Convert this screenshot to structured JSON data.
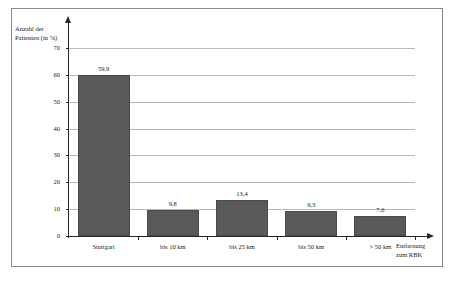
{
  "chart_data": {
    "type": "bar",
    "title": "",
    "categories": [
      "Stuttgart",
      "bis 10 km",
      "bis 25 km",
      "bis 50 km",
      "> 50 km"
    ],
    "values": [
      59.9,
      9.8,
      13.4,
      9.3,
      7.6
    ],
    "value_labels": [
      "59,9",
      "9,8",
      "13,4",
      "9,3",
      "7,6"
    ],
    "ylabel_line1": "Anzahl der",
    "ylabel_line2": "Patienten (in %)",
    "xlabel_line1": "Entfernung",
    "xlabel_line2": "zum RBK",
    "ylim": [
      0,
      70
    ],
    "ytick_labels": [
      "0",
      "10",
      "20",
      "30",
      "40",
      "50",
      "60",
      "70"
    ],
    "ytick_values": [
      0,
      10,
      20,
      30,
      40,
      50,
      60,
      70
    ],
    "grid": true,
    "legend": "none",
    "bar_color": "#595959",
    "grid_color": "#b9b9b9",
    "axis_color": "#262626"
  }
}
